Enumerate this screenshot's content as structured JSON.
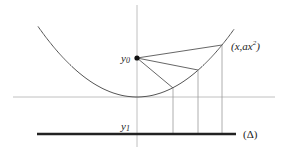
{
  "diagram": {
    "type": "parabola-focus-directrix",
    "colors": {
      "axis": "#b0b0b0",
      "curve": "#555555",
      "segment": "#555555",
      "drop_line": "#999999",
      "directrix": "#222222",
      "point": "#111111",
      "text": "#222222"
    },
    "labels": {
      "focus_label_base": "y",
      "focus_label_sub": "0",
      "directrix_level_base": "y",
      "directrix_level_sub": "1",
      "curve_point_label_prefix": "(x,ax",
      "curve_point_label_sup": "2",
      "curve_point_label_suffix": ")",
      "directrix_label": "(Δ)"
    },
    "geometry": {
      "vertical_axis": {
        "x": 137,
        "y1": 5,
        "y2": 147
      },
      "horizontal_axis": {
        "y": 97,
        "x1": 13,
        "x2": 275
      },
      "vertex": {
        "x": 137,
        "y": 97
      },
      "parabola_k": 0.0072,
      "parabola_x_range": [
        38,
        234
      ],
      "focus": {
        "x": 137,
        "y": 58
      },
      "curve_points": [
        {
          "x": 173,
          "y": 88
        },
        {
          "x": 198,
          "y": 70
        },
        {
          "x": 222,
          "y": 45
        }
      ],
      "directrix": {
        "y": 134,
        "x1": 37,
        "x2": 236
      }
    }
  }
}
